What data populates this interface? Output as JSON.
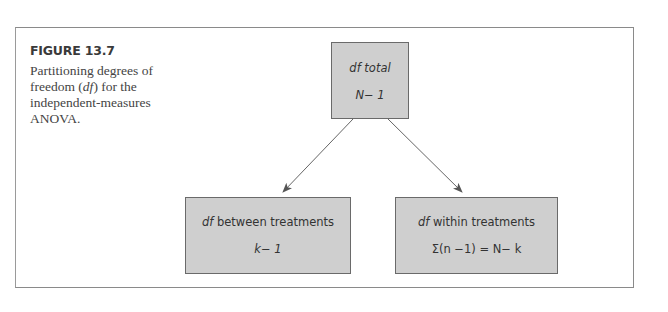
{
  "figure": {
    "label": "FIGURE 13.7",
    "caption_pre": "Partitioning degrees of freedom (",
    "caption_df": "df",
    "caption_post": ") for the independent-measures ANOVA."
  },
  "diagram": {
    "nodes": [
      {
        "id": "total",
        "title_italic": "df",
        "title_rest": " total",
        "formula": "N− 1"
      },
      {
        "id": "between",
        "title_italic": "df",
        "title_rest": " between treatments",
        "formula": "k− 1"
      },
      {
        "id": "within",
        "title_italic": "df",
        "title_rest": " within treatments",
        "formula": "Σ(n −1) = N− k"
      }
    ],
    "edges": [
      {
        "from": "total",
        "to": "between"
      },
      {
        "from": "total",
        "to": "within"
      }
    ],
    "colors": {
      "box_fill": "#cfcfcf",
      "box_border": "#6a6a6a",
      "arrow": "#555555",
      "frame": "#8a8a8a"
    }
  }
}
